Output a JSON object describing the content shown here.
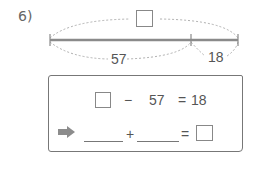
{
  "problem": {
    "number_label": "6)",
    "diagram": {
      "total_placeholder": "",
      "left_segment": "57",
      "right_segment": "18"
    },
    "equation1": {
      "unknown": "",
      "operator": "−",
      "operand": "57",
      "equals": "=",
      "result": "18"
    },
    "equation2": {
      "arrow_icon": "right-arrow",
      "blank1": "",
      "operator": "+",
      "blank2": "",
      "equals": "=",
      "answer": ""
    }
  },
  "colors": {
    "line": "#8a8a8a",
    "dashed": "#b0b0b0",
    "arrow": "#8c8c8c",
    "text": "#555555"
  }
}
